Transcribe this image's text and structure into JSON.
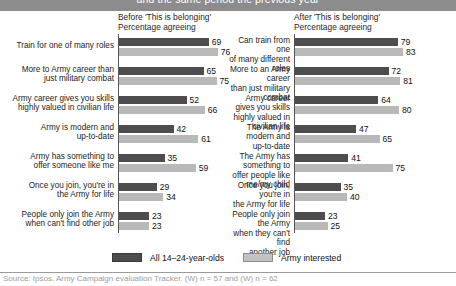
{
  "banner": {
    "text": "and the same period the previous year"
  },
  "legend": {
    "items": [
      {
        "label": "All 14–24-year-olds",
        "swatch": "dark",
        "color": "#4d4d4d"
      },
      {
        "label": "Army interested",
        "swatch": "light",
        "color": "#c2c2c2"
      }
    ]
  },
  "source": {
    "text": "Source: Ipsos, Army Campaign evaluation Tracker. (W) n = 57 and (W) n = 62"
  },
  "chart_data": [
    {
      "type": "bar",
      "orientation": "horizontal",
      "panel": "left",
      "title": "Before 'This is belonging'",
      "subtitle": "Percentage agreeing",
      "xlabel": "",
      "ylabel": "",
      "xlim": [
        0,
        100
      ],
      "grid": false,
      "legend_position": "bottom",
      "categories": [
        "Train for one of many roles",
        "More to Army career than\njust military combat",
        "Army career gives you skills\nhighly valued in civilian life",
        "Army is modern and\nup-to-date",
        "Army has something to\noffer someone like me",
        "Once you join, you're in\nthe Army for life",
        "People only join the Army\nwhen can't find other job"
      ],
      "series": [
        {
          "name": "All 14–24-year-olds",
          "color": "#4d4d4d",
          "values": [
            69,
            65,
            52,
            42,
            35,
            29,
            23
          ]
        },
        {
          "name": "Army interested",
          "color": "#b9b9b9",
          "values": [
            76,
            75,
            66,
            61,
            59,
            34,
            23
          ]
        }
      ]
    },
    {
      "type": "bar",
      "orientation": "horizontal",
      "panel": "right",
      "title": "After 'This is belonging'",
      "subtitle": "Percentage agreeing",
      "xlabel": "",
      "ylabel": "",
      "xlim": [
        0,
        100
      ],
      "grid": false,
      "legend_position": "bottom",
      "categories": [
        "Can train from one\nof many different roles",
        "More to an Army career\nthan just military combat",
        "Army career gives you skills\nhighly valued in civilian life",
        "The Army is modern and\nup-to-date",
        "The Army has something to\noffer people like me/my child",
        "Once you join, you're in\nthe Army for life",
        "People only join the Army\nwhen they can't find\nanother job"
      ],
      "series": [
        {
          "name": "All 14–24-year-olds",
          "color": "#4d4d4d",
          "values": [
            79,
            72,
            64,
            47,
            41,
            35,
            23
          ]
        },
        {
          "name": "Army interested",
          "color": "#b9b9b9",
          "values": [
            83,
            81,
            80,
            65,
            75,
            40,
            25
          ]
        }
      ]
    }
  ]
}
